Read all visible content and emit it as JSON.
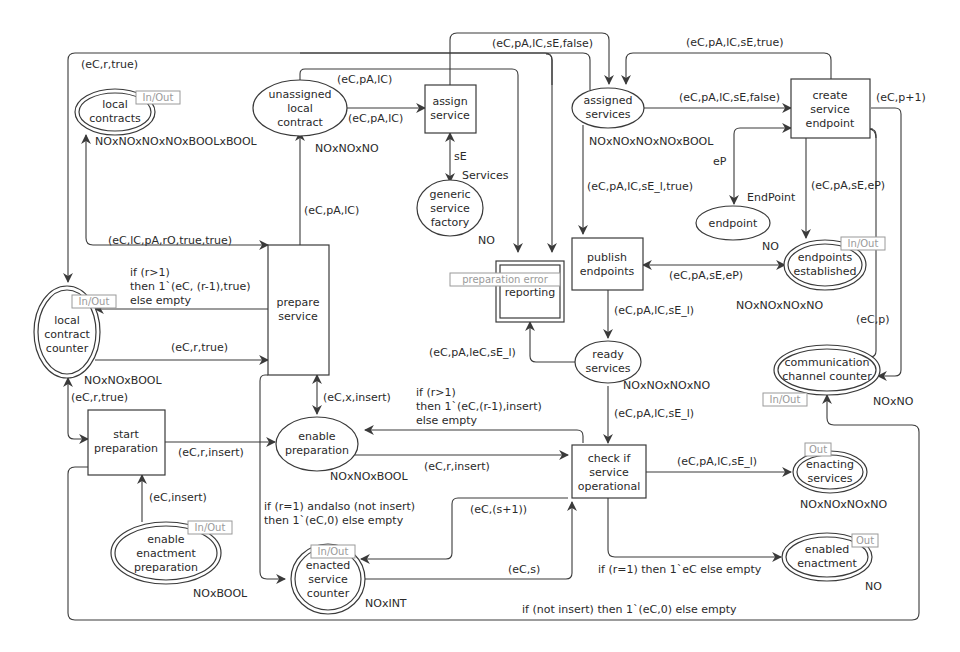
{
  "places": {
    "local_contracts": {
      "name": [
        "local",
        "contracts"
      ],
      "colset": "NOxNOxNOxNOxBOOLxBOOL",
      "port": "In/Out"
    },
    "unassigned_local_contract": {
      "name": [
        "unassigned",
        "local",
        "contract"
      ],
      "colset": "NOxNOxNO"
    },
    "generic_service_factory": {
      "name": [
        "generic",
        "service",
        "factory"
      ],
      "colset": "NO",
      "colset2": "Services"
    },
    "assigned_services": {
      "name": [
        "assigned",
        "services"
      ],
      "colset": "NOxNOxNOxNOxBOOL"
    },
    "endpoint": {
      "name": [
        "endpoint"
      ],
      "colset": "NO",
      "colset2": "EndPoint"
    },
    "endpoints_established": {
      "name": [
        "endpoints",
        "established"
      ],
      "colset": "NOxNOxNOxNO",
      "port": "In/Out"
    },
    "local_contract_counter": {
      "name": [
        "local",
        "contract",
        "counter"
      ],
      "colset": "NOxNOxBOOL",
      "port": "In/Out"
    },
    "ready_services": {
      "name": [
        "ready",
        "services"
      ],
      "colset": "NOxNOxNOxNO"
    },
    "communication_channel_counter": {
      "name": [
        "communication",
        "channel counter"
      ],
      "colset": "NOxNO",
      "port": "In/Out"
    },
    "enable_preparation": {
      "name": [
        "enable",
        "preparation"
      ],
      "colset": "NOxNOxBOOL"
    },
    "enacting_services": {
      "name": [
        "enacting",
        "services"
      ],
      "colset": "NOxNOxNOxNO",
      "port": "Out"
    },
    "enable_enactment_preparation": {
      "name": [
        "enable",
        "enactment",
        "preparation"
      ],
      "colset": "NOxBOOL",
      "port": "In/Out"
    },
    "enacted_service_counter": {
      "name": [
        "enacted",
        "service",
        "counter"
      ],
      "colset": "NOxINT",
      "port": "In/Out"
    },
    "enabled_enactment": {
      "name": [
        "enabled",
        "enactment"
      ],
      "colset": "NO",
      "port": "Out"
    }
  },
  "transitions": {
    "assign_service": {
      "name": [
        "assign",
        "service"
      ]
    },
    "create_service_endpoint": {
      "name": [
        "create",
        "service",
        "endpoint"
      ]
    },
    "publish_endpoints": {
      "name": [
        "publish",
        "endpoints"
      ]
    },
    "reporting": {
      "name": [
        "reporting"
      ],
      "subpage_tag": "preparation error"
    },
    "prepare_service": {
      "name": [
        "prepare",
        "service"
      ]
    },
    "start_preparation": {
      "name": [
        "start",
        "preparation"
      ]
    },
    "check_service_operational": {
      "name": [
        "check if",
        "service",
        "operational"
      ]
    }
  },
  "arcs": {
    "top_loop_local_contract_counter": "(eC,r,true)",
    "unassigned_to_assign_top": "(eC,pA,lC)",
    "unassigned_to_assign": "(eC,pA,lC)",
    "assign_to_assigned_false": "(eC,pA,lC,sE,false)",
    "create_to_assigned_true": "(eC,pA,lC,sE,true)",
    "assigned_to_create_false": "(eC,pA,lC,sE,false)",
    "create_to_comm_counter": "(eC,p+1)",
    "assign_factory": "sE",
    "create_endpoint": "eP",
    "create_to_established": "(eC,pA,sE,eP)",
    "assigned_to_publish": "(eC,pA,lC,sE_l,true)",
    "prepare_to_unassigned": "(eC,pA,lC)",
    "local_contracts_to_prepare": "(eC,lC,pA,rO,true,true)",
    "prepare_to_counter": [
      "if (r>1)",
      "then 1`(eC, (r-1),true)",
      "else empty"
    ],
    "counter_to_prepare": "(eC,r,true)",
    "publish_established": "(eC,pA,sE,eP)",
    "publish_to_ready": "(eC,pA,lC,sE_l)",
    "ready_to_reporting": "(eC,pA,leC,sE_l)",
    "comm_counter_to_create": "(eC,p)",
    "prepare_enable": "(eC,x,insert)",
    "check_to_enable": [
      "if (r>1)",
      "then 1`(eC,(r-1),insert)",
      "else empty"
    ],
    "ready_to_check": "(eC,pA,lC,sE_l)",
    "counter_start": "(eC,r,true)",
    "start_to_enable": "(eC,r,insert)",
    "enable_to_check": "(eC,r,insert)",
    "check_to_enacting": "(eC,pA,lC,sE_l)",
    "eep_to_start": "(eC,insert)",
    "prepare_to_enacted": [
      "if (r=1) andalso (not insert)",
      "then 1`(eC,0) else empty"
    ],
    "check_to_enacted": "(eC,(s+1))",
    "enacted_to_check": "(eC,s)",
    "check_to_enabled": "if (r=1) then 1`eC else empty",
    "start_to_comm_counter": "if (not insert) then 1`(eC,0) else empty"
  },
  "colors": {
    "stroke": "#3a3a3a",
    "text": "#2a2a2a",
    "port_tag": "#9a9a9a",
    "background": "#ffffff"
  }
}
